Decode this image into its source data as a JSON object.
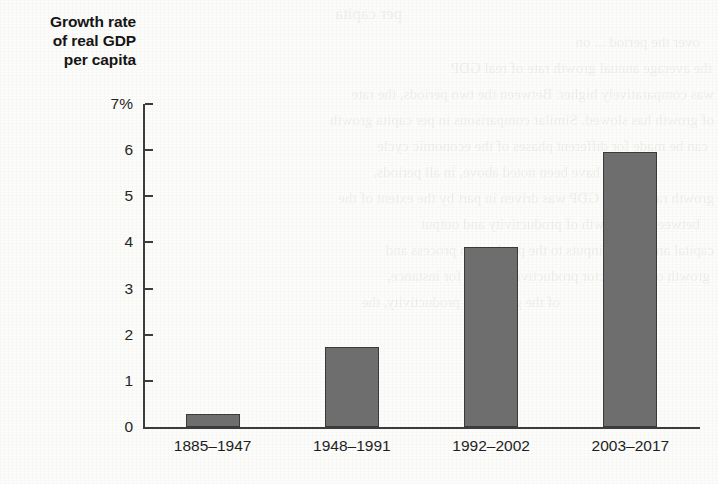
{
  "figure": {
    "axis_title_lines": [
      "Growth rate",
      "of real GDP",
      "per capita"
    ]
  },
  "chart_data": {
    "type": "bar",
    "title": "Growth rate of real GDP per capita",
    "xlabel": "",
    "ylabel": "Growth rate of real GDP per capita",
    "categories": [
      "1885–1947",
      "1948–1991",
      "1992–2002",
      "2003–2017"
    ],
    "values": [
      0.29,
      1.74,
      3.91,
      5.96
    ],
    "ylim": [
      0,
      7
    ],
    "yticks": [
      0,
      1,
      2,
      3,
      4,
      5,
      6,
      7
    ],
    "ytick_labels": [
      "0",
      "1",
      "2",
      "3",
      "4",
      "5",
      "6",
      "7%"
    ],
    "grid": false,
    "legend": false,
    "bar_color": "#6e6e6e",
    "bar_edge_color": "#3a3a3a",
    "axis_color": "#3c3c3c",
    "unit": "%"
  },
  "ghost_text": {
    "lines": [
      "per capita",
      "over the period ... on",
      "the average annual growth rate of real GDP",
      "was comparatively higher. Between the two periods, the rate",
      "of growth has slowed. Similar comparisons in per capita growth",
      "can be made for different phases of the economic cycle",
      "have been noted above, in all periods,",
      "growth rate of real GDP was driven in part by the extent of the",
      "between the growth of productivity and output",
      "capital and labour inputs to the production process and",
      "growth of total factor productivity. Thus, for instance,",
      "of the growth in productivity, the"
    ]
  }
}
